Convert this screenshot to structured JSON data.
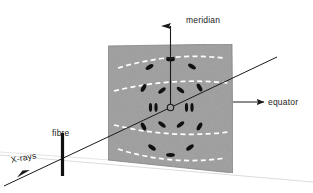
{
  "diagram": {
    "labels": {
      "meridian": "meridian",
      "equator": "equator",
      "fibre": "fibre",
      "xrays": "X-rays"
    },
    "colors": {
      "panel_fill": "#9d9d9d",
      "panel_edge": "#7b7b7b",
      "layer_line": "#ffffff",
      "spot": "#101010",
      "axis": "#1a1a1a",
      "ground_line": "#d8d8d8",
      "background": "#ffffff",
      "text": "#1a1a1a"
    },
    "panel": {
      "name": "detector-panel",
      "corners": [
        [
          108,
          46
        ],
        [
          232,
          44
        ],
        [
          233,
          173
        ],
        [
          108,
          160
        ]
      ],
      "noise": true
    },
    "center": {
      "name": "beam-center",
      "x": 170.5,
      "y": 107.5,
      "r": 3.2
    },
    "meridian_axis": {
      "from": [
        170.5,
        107.5
      ],
      "to": [
        170.5,
        16
      ],
      "arrow": true,
      "tick_y": 58
    },
    "equator_axis": {
      "from": [
        170.5,
        107.5
      ],
      "to": [
        277,
        58
      ],
      "label_arrow_from": [
        232,
        102
      ],
      "label_arrow_to": [
        265,
        102
      ],
      "arrow": true
    },
    "beam_axis": {
      "from": [
        170.5,
        107.5
      ],
      "to": [
        6,
        185
      ],
      "arrow_at": [
        22,
        176
      ]
    },
    "ground_line": {
      "from": [
        0,
        155
      ],
      "to": [
        313,
        182
      ]
    },
    "fibre_bar": {
      "name": "fibre-sample",
      "x": 62,
      "y_top": 133,
      "y_bottom": 176,
      "width": 3.0
    },
    "layer_lines": [
      {
        "id": "L+2",
        "cy": 63,
        "sag": 11,
        "x1": 118,
        "x2": 224,
        "dash": "5,3.4"
      },
      {
        "id": "L+1",
        "cy": 86,
        "sag": 9,
        "x1": 114,
        "x2": 228,
        "dash": "5,3.4"
      },
      {
        "id": "L-1",
        "cy": 129,
        "sag": -9,
        "x1": 114,
        "x2": 229,
        "dash": "5,3.4"
      },
      {
        "id": "L-2",
        "cy": 154,
        "sag": -11,
        "x1": 118,
        "x2": 226,
        "dash": "5,3.4"
      }
    ],
    "spots": [
      {
        "x": 170.5,
        "y": 59.5,
        "rx": 4.4,
        "ry": 1.9,
        "rot": 0
      },
      {
        "x": 149.5,
        "y": 67.0,
        "rx": 4.4,
        "ry": 2.0,
        "rot": -32
      },
      {
        "x": 192.0,
        "y": 66.5,
        "rx": 4.4,
        "ry": 2.0,
        "rot": 32
      },
      {
        "x": 143.5,
        "y": 88.0,
        "rx": 4.3,
        "ry": 2.1,
        "rot": -62
      },
      {
        "x": 162.0,
        "y": 90.5,
        "rx": 4.4,
        "ry": 2.0,
        "rot": -38
      },
      {
        "x": 180.5,
        "y": 90.0,
        "rx": 4.4,
        "ry": 2.0,
        "rot": 38
      },
      {
        "x": 199.5,
        "y": 87.5,
        "rx": 4.3,
        "ry": 2.1,
        "rot": 60
      },
      {
        "x": 150.5,
        "y": 107.5,
        "rx": 1.6,
        "ry": 4.4,
        "rot": 0
      },
      {
        "x": 156.0,
        "y": 107.5,
        "rx": 1.6,
        "ry": 4.4,
        "rot": 0
      },
      {
        "x": 186.5,
        "y": 107.5,
        "rx": 1.6,
        "ry": 4.4,
        "rot": 0
      },
      {
        "x": 192.0,
        "y": 107.5,
        "rx": 1.6,
        "ry": 4.4,
        "rot": 0
      },
      {
        "x": 143.5,
        "y": 126.5,
        "rx": 4.3,
        "ry": 2.1,
        "rot": 62
      },
      {
        "x": 162.0,
        "y": 124.5,
        "rx": 4.4,
        "ry": 2.0,
        "rot": 38
      },
      {
        "x": 180.5,
        "y": 124.5,
        "rx": 4.4,
        "ry": 2.0,
        "rot": -38
      },
      {
        "x": 199.5,
        "y": 126.5,
        "rx": 4.3,
        "ry": 2.1,
        "rot": -60
      },
      {
        "x": 152.0,
        "y": 147.5,
        "rx": 4.4,
        "ry": 2.0,
        "rot": 35
      },
      {
        "x": 170.5,
        "y": 155.0,
        "rx": 4.4,
        "ry": 1.9,
        "rot": 0
      },
      {
        "x": 190.0,
        "y": 147.5,
        "rx": 4.4,
        "ry": 2.0,
        "rot": -35
      }
    ]
  }
}
